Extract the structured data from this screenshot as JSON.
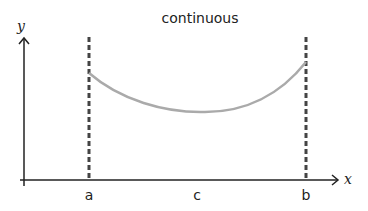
{
  "diagram": {
    "title": "continuous",
    "axes": {
      "x_label": "x",
      "y_label": "y"
    },
    "points": [
      {
        "id": "a",
        "label": "a"
      },
      {
        "id": "c",
        "label": "c"
      },
      {
        "id": "b",
        "label": "b"
      }
    ],
    "curve": {
      "description": "continuous U-shaped curve from a to b with minimum near c",
      "color": "#aaaaaa"
    },
    "boundary_lines": {
      "style": "dashed",
      "color": "#444444"
    },
    "colors": {
      "axis": "#222222",
      "text": "#222222",
      "curve": "#aaaaaa",
      "dashed": "#444444"
    }
  }
}
